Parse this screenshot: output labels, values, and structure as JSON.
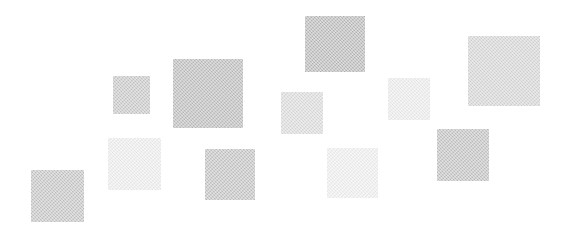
{
  "canvas": {
    "width": 564,
    "height": 234,
    "background_color": "#ffffff",
    "description": "Abstract composition of eleven scattered light-gray squares on a white background"
  },
  "squares": [
    {
      "id": "square-1",
      "x": 31,
      "y": 170,
      "width": 53,
      "height": 52,
      "color": "#c6c6c6"
    },
    {
      "id": "square-2",
      "x": 108,
      "y": 138,
      "width": 53,
      "height": 52,
      "color": "#eeeeee"
    },
    {
      "id": "square-3",
      "x": 113,
      "y": 76,
      "width": 37,
      "height": 38,
      "color": "#c9c9c9"
    },
    {
      "id": "square-4",
      "x": 173,
      "y": 59,
      "width": 70,
      "height": 69,
      "color": "#bdbdbd"
    },
    {
      "id": "square-5",
      "x": 205,
      "y": 149,
      "width": 50,
      "height": 51,
      "color": "#c4c4c4"
    },
    {
      "id": "square-6",
      "x": 281,
      "y": 92,
      "width": 42,
      "height": 42,
      "color": "#dcdcdc"
    },
    {
      "id": "square-7",
      "x": 305,
      "y": 16,
      "width": 60,
      "height": 56,
      "color": "#bababa"
    },
    {
      "id": "square-8",
      "x": 327,
      "y": 148,
      "width": 51,
      "height": 50,
      "color": "#f0f0f0"
    },
    {
      "id": "square-9",
      "x": 388,
      "y": 78,
      "width": 42,
      "height": 42,
      "color": "#ededed"
    },
    {
      "id": "square-10",
      "x": 437,
      "y": 129,
      "width": 52,
      "height": 52,
      "color": "#c3c3c3"
    },
    {
      "id": "square-11",
      "x": 468,
      "y": 36,
      "width": 72,
      "height": 70,
      "color": "#d6d6d6"
    }
  ]
}
